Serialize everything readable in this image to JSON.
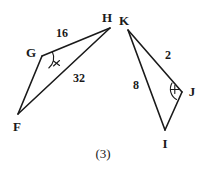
{
  "figure": {
    "caption": "(3)",
    "stroke_color": "#1a1a1a",
    "text_color": "#1a1a1a",
    "background_color": "#ffffff",
    "vertices": [
      {
        "name": "F",
        "label": "F",
        "x": 18,
        "y": 114,
        "label_x": 17,
        "label_y": 126
      },
      {
        "name": "G",
        "label": "G",
        "x": 42,
        "y": 56,
        "label_x": 31,
        "label_y": 52
      },
      {
        "name": "H",
        "label": "H",
        "x": 110,
        "y": 28,
        "label_x": 107,
        "label_y": 17
      },
      {
        "name": "K",
        "label": "K",
        "x": 128,
        "y": 30,
        "label_x": 124,
        "label_y": 20
      },
      {
        "name": "J",
        "label": "J",
        "x": 182,
        "y": 92,
        "label_x": 192,
        "label_y": 91
      },
      {
        "name": "I",
        "label": "I",
        "x": 165,
        "y": 130,
        "label_x": 165,
        "label_y": 143
      }
    ],
    "segments": [
      {
        "name": "segment-GH",
        "from": "G",
        "to": "H"
      },
      {
        "name": "segment-GF",
        "from": "G",
        "to": "F"
      },
      {
        "name": "segment-FH",
        "from": "F",
        "to": "H"
      },
      {
        "name": "segment-KJ",
        "from": "K",
        "to": "J"
      },
      {
        "name": "segment-KI",
        "from": "K",
        "to": "I"
      },
      {
        "name": "segment-IJ",
        "from": "I",
        "to": "J"
      }
    ],
    "measures": [
      {
        "name": "measure-GH",
        "value": "16",
        "x": 62,
        "y": 33
      },
      {
        "name": "measure-FH",
        "value": "32",
        "x": 79,
        "y": 78
      },
      {
        "name": "measure-KJ",
        "value": "2",
        "x": 168,
        "y": 55
      },
      {
        "name": "measure-KI",
        "value": "8",
        "x": 136,
        "y": 85
      }
    ],
    "angle_marks": [
      {
        "name": "angle-mark-G",
        "vertex": "G",
        "x": 47,
        "y": 62
      },
      {
        "name": "angle-mark-J",
        "vertex": "J",
        "x": 177,
        "y": 89
      }
    ]
  }
}
